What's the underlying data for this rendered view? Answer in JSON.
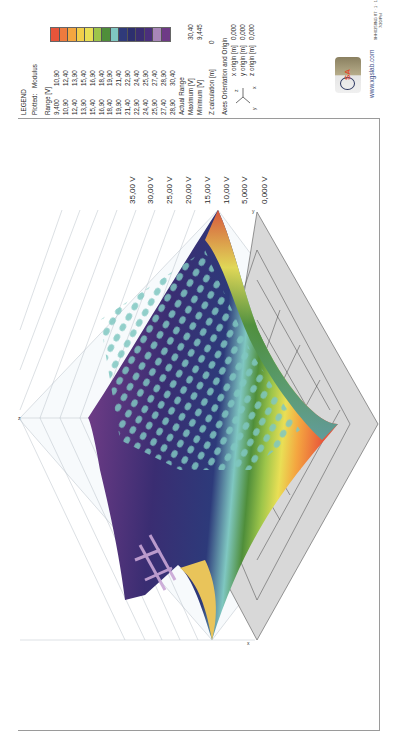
{
  "header": {
    "doc_ref": "9HH0258NG 87 · 1 · 1 · E · RN WF5030",
    "doc_sub": "7/20/Pol"
  },
  "legend": {
    "title": "LEGEND",
    "plotted_label": "Plotted:",
    "plotted_value": "Modulus",
    "range_label": "Range [V]",
    "ranges": [
      {
        "from": "9,400",
        "to": "10,90"
      },
      {
        "from": "10,90",
        "to": "12,40"
      },
      {
        "from": "12,40",
        "to": "13,90"
      },
      {
        "from": "13,90",
        "to": "15,40"
      },
      {
        "from": "15,40",
        "to": "16,90"
      },
      {
        "from": "16,90",
        "to": "18,40"
      },
      {
        "from": "18,40",
        "to": "19,90"
      },
      {
        "from": "19,90",
        "to": "21,40"
      },
      {
        "from": "21,40",
        "to": "22,90"
      },
      {
        "from": "22,90",
        "to": "24,40"
      },
      {
        "from": "24,40",
        "to": "25,90"
      },
      {
        "from": "25,90",
        "to": "27,40"
      },
      {
        "from": "27,40",
        "to": "28,90"
      },
      {
        "from": "28,90",
        "to": "30,40"
      }
    ],
    "colors": [
      "#e8543a",
      "#ee7b3e",
      "#f4a640",
      "#f2cf4a",
      "#e9df55",
      "#9dc54a",
      "#4f8e3a",
      "#7fc7c1",
      "#2f3a7a",
      "#2d2f6e",
      "#3a2d72",
      "#4b2f7c",
      "#a886b8",
      "#6e3a86"
    ],
    "actual_range_label": "Actual Range",
    "maximum_label": "Maximum [V]",
    "maximum_value": "30,40",
    "minimum_label": "Minimum [V]",
    "minimum_value": "9,445",
    "z_calc_label": "Z calculation [m]",
    "z_calc_value": "0",
    "axes_title": "Axes Orientation and Origin",
    "x_origin_label": "x origin [m]",
    "x_origin_value": "0,000",
    "y_origin_label": "y origin [m]",
    "y_origin_value": "0,000",
    "z_origin_label": "z origin [m]",
    "z_origin_value": "0,000",
    "axis_x": "x",
    "axis_y": "y",
    "axis_z": "z"
  },
  "brand": {
    "logo_text": "SA",
    "url": "www.xgslab.com"
  },
  "chart_data": {
    "type": "heatmap",
    "subtype": "3d-surface",
    "zlabel": "Voltage [V]",
    "z_ticks": [
      "0,000 V",
      "5,000 V",
      "10,00 V",
      "15,00 V",
      "20,00 V",
      "25,00 V",
      "30,00 V",
      "35,00 V"
    ],
    "zlim": [
      0,
      35
    ],
    "axes": [
      "x",
      "y",
      "z"
    ],
    "value_range": {
      "min": 9.445,
      "max": 30.4
    },
    "color_bins": [
      9.4,
      10.9,
      12.4,
      13.9,
      15.4,
      16.9,
      18.4,
      19.9,
      21.4,
      22.9,
      24.4,
      25.9,
      27.4,
      28.9,
      30.4
    ]
  }
}
